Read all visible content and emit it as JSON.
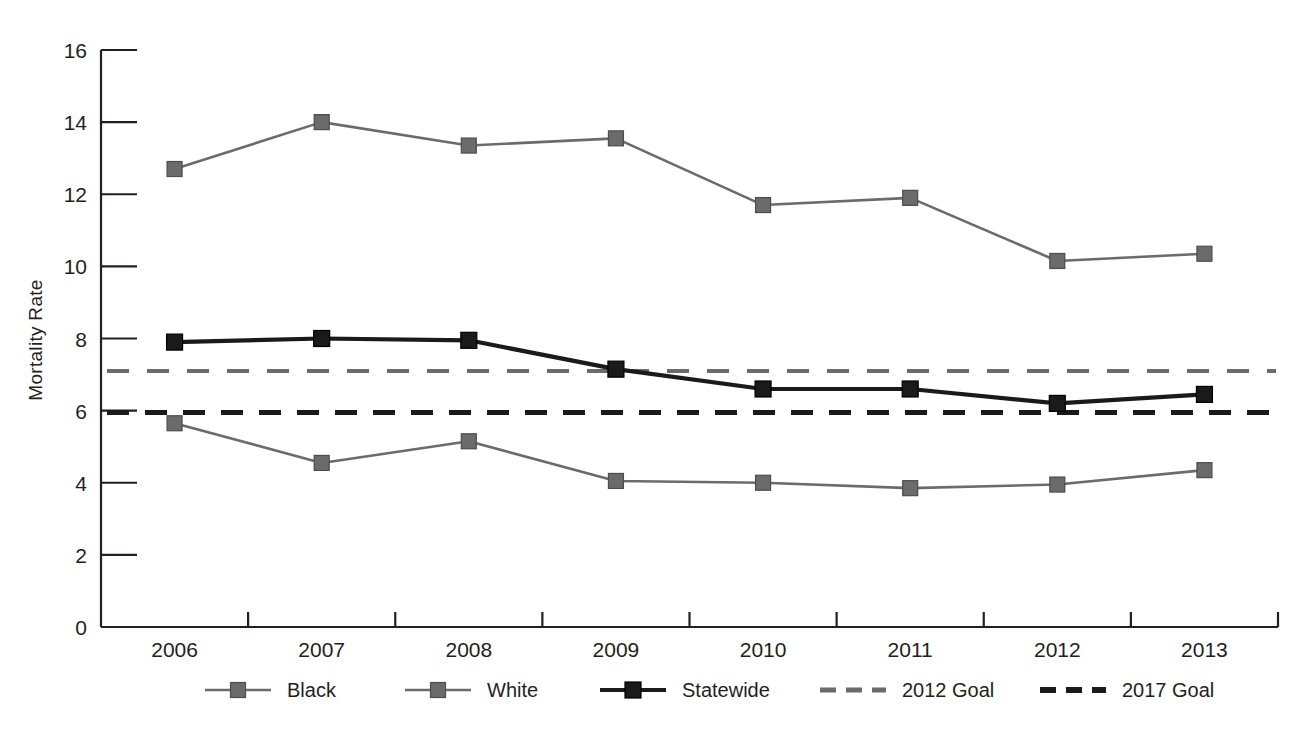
{
  "chart_data": {
    "type": "line",
    "title": "",
    "xlabel": "",
    "ylabel": "Mortality Rate",
    "categories": [
      "2006",
      "2007",
      "2008",
      "2009",
      "2010",
      "2011",
      "2012",
      "2013"
    ],
    "ylim": [
      0,
      16
    ],
    "yticks": [
      0,
      2,
      4,
      6,
      8,
      10,
      12,
      14,
      16
    ],
    "ytick_labels": [
      "0",
      "2",
      "4",
      "6",
      "8",
      "10",
      "12",
      "14",
      "16"
    ],
    "grid": false,
    "legend_position": "bottom",
    "series": [
      {
        "name": "Black",
        "style": "solid-marker",
        "color": "#6b6b6b",
        "values": [
          12.7,
          14.0,
          13.35,
          13.55,
          11.7,
          11.9,
          10.15,
          10.35
        ]
      },
      {
        "name": "White",
        "style": "solid-marker",
        "color": "#6b6b6b",
        "values": [
          5.65,
          4.55,
          5.15,
          4.05,
          4.0,
          3.85,
          3.95,
          4.35
        ]
      },
      {
        "name": "Statewide",
        "style": "solid-marker-bold",
        "color": "#1a1a1a",
        "values": [
          7.9,
          8.0,
          7.95,
          7.15,
          6.6,
          6.6,
          6.2,
          6.45
        ]
      },
      {
        "name": "2012 Goal",
        "style": "dashed",
        "color": "#6b6b6b",
        "constant": 7.1
      },
      {
        "name": "2017 Goal",
        "style": "dashed-bold",
        "color": "#1a1a1a",
        "constant": 5.95
      }
    ]
  },
  "legend": {
    "items": [
      {
        "label": "Black"
      },
      {
        "label": "White"
      },
      {
        "label": "Statewide"
      },
      {
        "label": "2012 Goal"
      },
      {
        "label": "2017 Goal"
      }
    ]
  },
  "colors": {
    "axis": "#231f20",
    "gray_series": "#6b6b6b",
    "black_series": "#1a1a1a",
    "background": "#ffffff"
  }
}
